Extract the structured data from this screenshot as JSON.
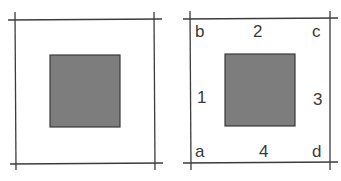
{
  "figures": [
    {
      "id": "left",
      "description": "Square frame with a gray center square, no labels",
      "frame_lines": {
        "left_x": 15,
        "right_x": 154,
        "top_y": 20,
        "bottom_y": 163
      },
      "inner_square": {
        "x": 50,
        "y": 55,
        "w": 70,
        "h": 72
      },
      "labels": []
    },
    {
      "id": "right",
      "description": "Square frame with gray center square; corners labeled a-d, sides labeled 1-4",
      "frame_lines": {
        "left_x": 190,
        "right_x": 330,
        "top_y": 19,
        "bottom_y": 162
      },
      "inner_square": {
        "x": 225,
        "y": 54,
        "w": 70,
        "h": 72
      },
      "labels": {
        "corners": [
          {
            "text": "b",
            "position": "top-left"
          },
          {
            "text": "c",
            "position": "top-right"
          },
          {
            "text": "a",
            "position": "bottom-left"
          },
          {
            "text": "d",
            "position": "bottom-right"
          }
        ],
        "sides": [
          {
            "text": "1",
            "position": "left"
          },
          {
            "text": "2",
            "position": "top"
          },
          {
            "text": "3",
            "position": "right"
          },
          {
            "text": "4",
            "position": "bottom"
          }
        ]
      }
    }
  ],
  "colors": {
    "line": "#3c3c3c",
    "square_fill": "#7d7d7d",
    "square_stroke": "#3a3a3a",
    "label": "#3a3a3a"
  }
}
